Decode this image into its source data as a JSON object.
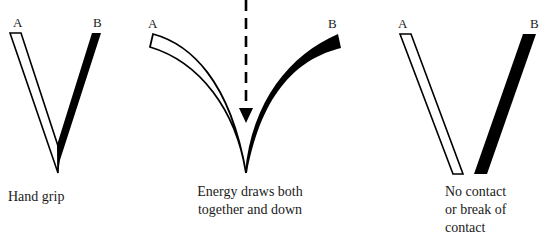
{
  "diagram": {
    "background": "#ffffff",
    "ink_color": "#000000",
    "panels": [
      {
        "id": "hand-grip",
        "label_a": "A",
        "label_b": "B",
        "caption_lines": [
          "Hand grip"
        ]
      },
      {
        "id": "energy",
        "label_a": "A",
        "label_b": "B",
        "caption_lines": [
          "Energy draws both",
          "together and down"
        ],
        "arrow": "dashed-down"
      },
      {
        "id": "no-contact",
        "label_a": "A",
        "label_b": "B",
        "caption_lines": [
          "No contact",
          "or break of",
          "contact"
        ]
      }
    ]
  }
}
